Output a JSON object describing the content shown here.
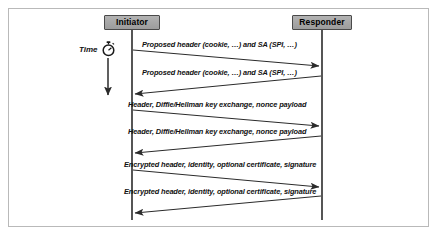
{
  "figure": {
    "type": "sequence-diagram",
    "frame": {
      "border_color": "#b9b9b9",
      "background": "#ffffff"
    }
  },
  "actors": [
    {
      "id": "initiator",
      "label": "Initiator",
      "x": 132,
      "fill": "#a8a8a8",
      "border": "#4a4a4a"
    },
    {
      "id": "responder",
      "label": "Responder",
      "x": 322,
      "fill": "#a8a8a8",
      "border": "#4a4a4a"
    }
  ],
  "time_axis": {
    "label": "Time",
    "icon": "stopwatch-icon",
    "arrow_direction": "down"
  },
  "messages": [
    {
      "index": 1,
      "label": "Proposed header (cookie, …) and SA (SPI, …)",
      "from": "initiator",
      "to": "responder",
      "direction": "right"
    },
    {
      "index": 2,
      "label": "Proposed header (cookie, …) and SA (SPI, …)",
      "from": "responder",
      "to": "initiator",
      "direction": "left"
    },
    {
      "index": 3,
      "label": "Header, Diffie/Hellman key exchange, nonce payload",
      "from": "initiator",
      "to": "responder",
      "direction": "right"
    },
    {
      "index": 4,
      "label": "Header, Diffie/Hellman key exchange, nonce payload",
      "from": "responder",
      "to": "initiator",
      "direction": "left"
    },
    {
      "index": 5,
      "label": "Encrypted header, identity, optional certificate, signature",
      "from": "initiator",
      "to": "responder",
      "direction": "right"
    },
    {
      "index": 6,
      "label": "Encrypted header, identity, optional certificate, signature",
      "from": "responder",
      "to": "initiator",
      "direction": "left"
    }
  ],
  "colors": {
    "line": "#2b2b2b",
    "text": "#111111",
    "actor_fill": "#a8a8a8",
    "frame": "#b9b9b9"
  }
}
